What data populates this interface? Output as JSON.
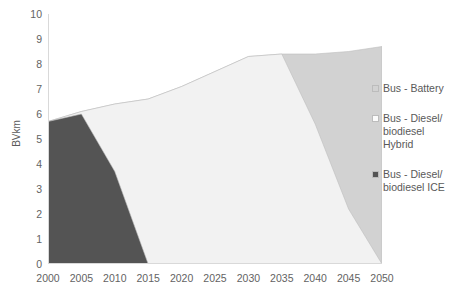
{
  "chart_data": {
    "type": "area",
    "stacked": true,
    "title": "",
    "xlabel": "",
    "ylabel": "BVkm",
    "x": [
      2000,
      2005,
      2010,
      2015,
      2020,
      2025,
      2030,
      2035,
      2040,
      2045,
      2050
    ],
    "xlim": [
      2000,
      2050
    ],
    "ylim": [
      0,
      10
    ],
    "xticks": [
      "2000",
      "2005",
      "2010",
      "2015",
      "2020",
      "2025",
      "2030",
      "2035",
      "2040",
      "2045",
      "2050"
    ],
    "yticks": [
      "0",
      "1",
      "2",
      "3",
      "4",
      "5",
      "6",
      "7",
      "8",
      "9",
      "10"
    ],
    "grid": false,
    "legend_position": "right",
    "series": [
      {
        "name": "Bus - Diesel/\nbiodiesel ICE",
        "color": "#545454",
        "values": [
          5.7,
          6.0,
          3.7,
          0.0,
          0.0,
          0.0,
          0.0,
          0.0,
          0.0,
          0.0,
          0.0
        ]
      },
      {
        "name": "Bus - Diesel/\nbiodiesel\nHybrid",
        "color": "#f2f2f2",
        "values": [
          0.0,
          0.1,
          2.7,
          6.6,
          7.1,
          7.7,
          8.3,
          8.4,
          5.6,
          2.2,
          0.0
        ]
      },
      {
        "name": "Bus - Battery",
        "color": "#d2d2d2",
        "values": [
          0.0,
          0.0,
          0.0,
          0.0,
          0.0,
          0.0,
          0.0,
          0.0,
          2.8,
          6.3,
          8.7
        ]
      }
    ],
    "totals": [
      5.7,
      6.1,
      6.4,
      6.6,
      7.1,
      7.7,
      8.3,
      8.4,
      8.4,
      8.5,
      8.7
    ]
  },
  "legend": {
    "items": [
      {
        "label": "Bus - Battery",
        "swatch_name": "legend-swatch-battery",
        "color": "#d2d2d2"
      },
      {
        "label": "Bus - Diesel/\nbiodiesel\nHybrid",
        "swatch_name": "legend-swatch-hybrid",
        "color": "#fbfbfb"
      },
      {
        "label": "Bus - Diesel/\nbiodiesel ICE",
        "swatch_name": "legend-swatch-ice",
        "color": "#545454"
      }
    ]
  },
  "axis": {
    "y_title": "BVkm",
    "axis_line_color": "#d9d9d9",
    "tick_label_color": "#636363"
  }
}
